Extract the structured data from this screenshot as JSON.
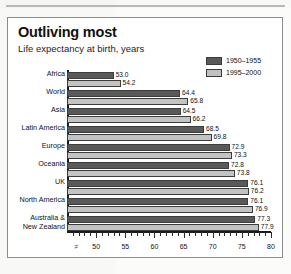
{
  "header": {
    "title": "Outliving most",
    "subtitle": "Life expectancy at birth, years"
  },
  "legend": {
    "items": [
      {
        "label": "1950–1955",
        "color": "#595959"
      },
      {
        "label": "1995–2000",
        "color": "#c3c3c3"
      }
    ]
  },
  "axis": {
    "break_marker": "≠",
    "tick_labels": [
      "50",
      "55",
      "60",
      "65",
      "70",
      "75",
      "80"
    ]
  },
  "chart_data": {
    "type": "bar",
    "orientation": "horizontal",
    "title": "Outliving most",
    "subtitle": "Life expectancy at birth, years",
    "xlabel": "",
    "ylabel": "",
    "xlim": [
      45,
      80
    ],
    "xticks": [
      50,
      55,
      60,
      65,
      70,
      75,
      80
    ],
    "minor_tick_step": 1,
    "grid": false,
    "legend_position": "top-right",
    "categories": [
      "Africa",
      "World",
      "Asia",
      "Latin America",
      "Europe",
      "Oceania",
      "UK",
      "North America",
      "Australia &\nNew Zealand"
    ],
    "series": [
      {
        "name": "1950–1955",
        "color": "#595959",
        "values": [
          53.0,
          64.4,
          64.5,
          68.5,
          72.9,
          72.8,
          76.1,
          76.1,
          77.3
        ],
        "labels": [
          "53.0",
          "64.4",
          "64.5",
          "68.5",
          "72.9",
          "72.8",
          "76.1",
          "76.1",
          "77.3"
        ]
      },
      {
        "name": "1995–2000",
        "color": "#c3c3c3",
        "values": [
          54.2,
          65.8,
          66.2,
          69.8,
          73.3,
          73.8,
          76.2,
          76.9,
          77.9
        ],
        "labels": [
          "54.2",
          "65.8",
          "66.2",
          "69.8",
          "73.3",
          "73.8",
          "76.2",
          "76.9",
          "77.9"
        ]
      }
    ]
  }
}
